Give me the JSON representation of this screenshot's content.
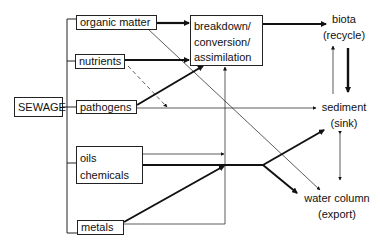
{
  "diagram": {
    "source": {
      "label": "SEWAGE"
    },
    "components": [
      {
        "id": "organic",
        "label": "organic matter"
      },
      {
        "id": "nutrients",
        "label": "nutrients"
      },
      {
        "id": "pathogens",
        "label": "pathogens"
      },
      {
        "id": "oils",
        "label_line1": "oils",
        "label_line2": "chemicals"
      },
      {
        "id": "metals",
        "label": "metals"
      }
    ],
    "process": {
      "line1": "breakdown/",
      "line2": "conversion/",
      "line3": "assimilation"
    },
    "fates": [
      {
        "id": "biota",
        "name": "biota",
        "role": "(recycle)"
      },
      {
        "id": "sediment",
        "name": "sediment",
        "role": "(sink)"
      },
      {
        "id": "water",
        "name": "water column",
        "role": "(export)"
      }
    ]
  }
}
